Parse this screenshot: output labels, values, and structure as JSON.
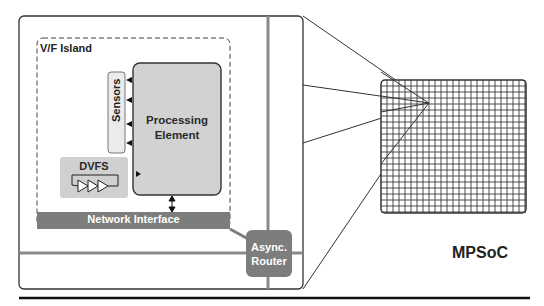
{
  "diagram": {
    "vf_island": {
      "label": "V/F Island"
    },
    "sensors": {
      "label": "Sensors",
      "arrow_count": 4
    },
    "processing_element": {
      "label_line1": "Processing",
      "label_line2": "Element"
    },
    "dvfs": {
      "label": "DVFS",
      "icon": "ring-oscillator-buffers-icon"
    },
    "network_interface": {
      "label": "Network Interface"
    },
    "router": {
      "label_line1": "Async.",
      "label_line2": "Router"
    },
    "mpsoc": {
      "label": "MPSoC",
      "grid": "mesh-grid"
    },
    "colors": {
      "outline": "#333333",
      "box_fill": "#d4d4d4",
      "sensor_fill": "#e8e8e8",
      "dark_fill": "#7a7a7a",
      "link_line": "#888888",
      "grid_line": "#3a3a3a"
    }
  }
}
